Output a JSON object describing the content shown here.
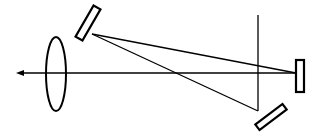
{
  "diagram": {
    "type": "optical-setup",
    "colors": {
      "background": "#ffffff",
      "line": "#000000"
    },
    "elements": {
      "optical_axis": {
        "x1": 20,
        "y1": 73,
        "x2": 300,
        "y2": 73
      },
      "arrowhead": {
        "tip_x": 16,
        "tip_y": 73,
        "direction": "left"
      },
      "lens": {
        "cx": 56,
        "cy": 74,
        "rx": 10,
        "ry": 37
      },
      "top_mirror": {
        "cx": 88,
        "cy": 23,
        "width": 8,
        "height": 36,
        "angle": 30
      },
      "right_mirror": {
        "cx": 300,
        "cy": 76,
        "width": 8,
        "height": 32,
        "angle": 0
      },
      "bottom_mirror": {
        "cx": 271,
        "cy": 117,
        "width": 7,
        "height": 34,
        "angle": 53
      },
      "vertical_line": {
        "x": 258,
        "y1": 15,
        "y2": 111
      },
      "ray_top_to_right": {
        "x1": 92,
        "y1": 34,
        "x2": 296,
        "y2": 73
      },
      "ray_top_to_bottom": {
        "x1": 92,
        "y1": 34,
        "x2": 258,
        "y2": 111
      }
    }
  }
}
